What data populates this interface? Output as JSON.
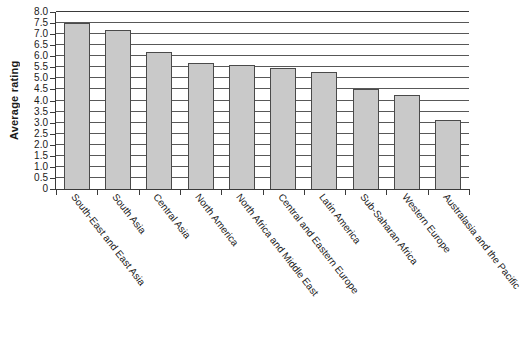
{
  "chart_data": {
    "type": "bar",
    "title": "",
    "xlabel": "",
    "ylabel": "Average rating",
    "ylim": [
      0,
      8.0
    ],
    "ytick_step": 0.5,
    "grid": true,
    "legend": false,
    "orientation": "vertical",
    "bar_fill_color": "#c9c9c9",
    "bar_edge_color": "#4a4a4a",
    "axis_color": "#3a3a3a",
    "yticks": [
      "0",
      "0.5",
      "1.0",
      "1.5",
      "2.0",
      "2.5",
      "3.0",
      "3.5",
      "4.0",
      "4.5",
      "5.0",
      "5.5",
      "6.0",
      "6.5",
      "7.0",
      "7.5",
      "8.0"
    ],
    "ytick_values": [
      0,
      0.5,
      1.0,
      1.5,
      2.0,
      2.5,
      3.0,
      3.5,
      4.0,
      4.5,
      5.0,
      5.5,
      6.0,
      6.5,
      7.0,
      7.5,
      8.0
    ],
    "categories": [
      "South-East and East Asia",
      "South Asia",
      "Central Asia",
      "North America",
      "North Africa and Middle East",
      "Central and Eastern Europe",
      "Latin America",
      "Sub-Saharan Africa",
      "Western Europe",
      "Australasia and the Pacific"
    ],
    "values": [
      7.5,
      7.2,
      6.2,
      5.7,
      5.6,
      5.45,
      5.3,
      4.5,
      4.25,
      3.1
    ]
  }
}
